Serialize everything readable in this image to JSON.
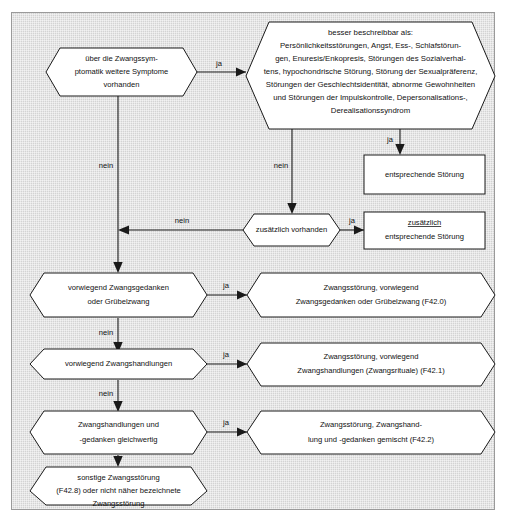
{
  "figure": {
    "type": "flowchart",
    "language": "de",
    "background_color": "#d3d3d3",
    "shape_fill": "#ffffff",
    "line_color": "#1a1a1a",
    "top_clipped_text": "",
    "nodes": [
      {
        "id": "q1",
        "shape": "hexagon",
        "lines": [
          "über die Zwangssym-",
          "ptomatik weitere Symptome",
          "vorhanden"
        ]
      },
      {
        "id": "desc",
        "shape": "hexagon",
        "lines": [
          "besser beschreibbar als:",
          "Persönlichkeitsstörungen, Angst, Ess-, Schlafstörun-",
          "gen, Enuresis/Enkopresis, Störungen des Sozialverhal-",
          "tens, hypochondrische Störung, Störung der Sexualpräferenz,",
          "Störungen der Geschlechtsidentität, abnorme Gewohnheiten",
          "und Störungen der Impulskontrolle, Depersonalisations-,",
          "Derealisationssyndrom"
        ]
      },
      {
        "id": "out1",
        "shape": "rectangle",
        "lines": [
          "entsprechende Störung"
        ]
      },
      {
        "id": "q2",
        "shape": "hexagon",
        "lines": [
          "zusätzlich vorhanden"
        ]
      },
      {
        "id": "out2",
        "shape": "rectangle",
        "lines": [
          "zusätzlich",
          "entsprechende Störung"
        ],
        "underline_first_line": true
      },
      {
        "id": "q3",
        "shape": "hexagon",
        "lines": [
          "vorwiegend Zwangsgedanken",
          "oder Grübelzwang"
        ]
      },
      {
        "id": "out3",
        "shape": "hexagon",
        "lines": [
          "Zwangsstörung, vorwiegend",
          "Zwangsgedanken oder Grübelzwang (F42.0)"
        ]
      },
      {
        "id": "q4",
        "shape": "hexagon",
        "lines": [
          "vorwiegend Zwangshandlungen"
        ]
      },
      {
        "id": "out4",
        "shape": "hexagon",
        "lines": [
          "Zwangsstörung, vorwiegend",
          "Zwangshandlungen (Zwangsrituale) (F42.1)"
        ]
      },
      {
        "id": "q5",
        "shape": "hexagon",
        "lines": [
          "Zwangshandlungen und",
          "-gedanken gleichwertig"
        ]
      },
      {
        "id": "out5",
        "shape": "hexagon",
        "lines": [
          "Zwangsstörung, Zwangshand-",
          "lung und -gedanken gemischt (F42.2)"
        ]
      },
      {
        "id": "out6",
        "shape": "hexagon",
        "lines": [
          "sonstige Zwangsstörung",
          "(F42.8) oder nicht näher bezeichnete",
          "Zwangsstörung"
        ]
      }
    ],
    "edges": [
      {
        "id": "e1",
        "from": "q1",
        "to": "desc",
        "label": "ja"
      },
      {
        "id": "e2",
        "from": "q1",
        "to": "q3-trunk",
        "label": "nein"
      },
      {
        "id": "e3",
        "from": "desc",
        "to": "out1",
        "label": "ja"
      },
      {
        "id": "e4",
        "from": "desc",
        "to": "q2",
        "label": "nein"
      },
      {
        "id": "e5",
        "from": "q2",
        "to": "out2",
        "label": "ja"
      },
      {
        "id": "e6",
        "from": "q2",
        "to": "trunk",
        "label": "nein"
      },
      {
        "id": "e7",
        "from": "q3",
        "to": "out3",
        "label": "ja"
      },
      {
        "id": "e8",
        "from": "q3",
        "to": "q4",
        "label": "nein"
      },
      {
        "id": "e9",
        "from": "q4",
        "to": "out4",
        "label": "ja"
      },
      {
        "id": "e10",
        "from": "q4",
        "to": "q5",
        "label": "nein"
      },
      {
        "id": "e11",
        "from": "q5",
        "to": "out5",
        "label": "ja"
      },
      {
        "id": "e12",
        "from": "q5",
        "to": "out6",
        "label": "nein"
      }
    ],
    "edge_labels": {
      "yes": "ja",
      "no": "nein"
    }
  }
}
